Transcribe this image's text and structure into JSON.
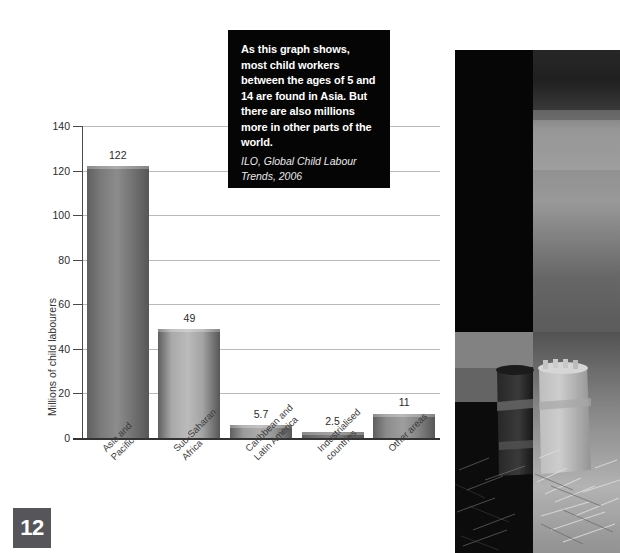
{
  "chart_data": {
    "type": "bar",
    "title": "",
    "xlabel": "",
    "ylabel": "Millions of child labourers",
    "categories": [
      "Asia and\nPacific",
      "Sub-Saharan\nAfrica",
      "Caribbean and\nLatin America",
      "Industrialised\ncountries",
      "Other areas"
    ],
    "values": [
      122,
      49,
      5.7,
      2.5,
      11
    ],
    "value_labels": [
      "122",
      "49",
      "5.7",
      "2.5",
      "11"
    ],
    "ylim": [
      0,
      140
    ],
    "yticks": [
      0,
      20,
      40,
      60,
      80,
      100,
      120,
      140
    ],
    "ytick_labels": [
      "0",
      "20",
      "40",
      "60",
      "80",
      "100",
      "120",
      "140"
    ],
    "grid": true,
    "legend": "none",
    "bar_colors": [
      "#7a7a7a",
      "#a9a9a9",
      "#9b9b9b",
      "#6f6f6f",
      "#8c8c8c"
    ]
  },
  "quote": {
    "body": "As this graph shows, most child workers between the ages of 5 and 14 are found in Asia. But there are also millions more in other parts of the world.",
    "source": "ILO, Global Child Labour Trends, 2006",
    "background": "#050505",
    "text_color": "#ffffff"
  },
  "photo": {
    "alt": "Grayscale photograph of a woven basket on the ground",
    "background": "#2e2e2e"
  },
  "page": {
    "number": "12",
    "badge_color": "#56565a"
  }
}
